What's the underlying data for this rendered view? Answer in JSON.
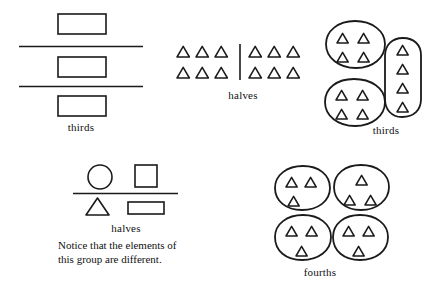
{
  "figure": {
    "stroke_color": "#1a1a1a",
    "background_color": "#ffffff"
  },
  "groups": [
    {
      "id": "thirds-bars",
      "label": "thirds",
      "kind": "divided-bar-set",
      "description": "Three rectangles separated by two horizontal division lines",
      "parts": 3,
      "shapes": [
        "rectangle",
        "rectangle",
        "rectangle"
      ],
      "dividers": 2
    },
    {
      "id": "halves-triangles",
      "label": "halves",
      "kind": "set-partition",
      "description": "Twelve triangles split by a vertical line into two equal sets of six",
      "parts": 2,
      "total_items": 12,
      "items_per_part": 6,
      "rows_per_part": 2,
      "columns_per_part": 3
    },
    {
      "id": "thirds-blobs",
      "label": "thirds",
      "kind": "set-partition",
      "description": "Twelve triangles enclosed in three loops of four triangles each",
      "parts": 3,
      "total_items": 12,
      "items_per_part": 4
    },
    {
      "id": "halves-mixed",
      "label": "halves",
      "kind": "set-partition",
      "description": "Four different shapes split by a horizontal line into two sets of two",
      "parts": 2,
      "total_items": 4,
      "items_per_part": 2,
      "shapes": [
        "circle",
        "square",
        "triangle",
        "rectangle"
      ]
    },
    {
      "id": "fourths-blobs",
      "label": "fourths",
      "kind": "set-partition",
      "description": "Twelve triangles enclosed in four loops of three triangles each",
      "parts": 4,
      "total_items": 12,
      "items_per_part": 3
    }
  ],
  "captions": {
    "thirds_left": "thirds",
    "halves_top": "halves",
    "thirds_right": "thirds",
    "halves_bottom": "halves",
    "fourths": "fourths"
  },
  "note": {
    "line1": "Notice that the elements of",
    "line2": "this group are different."
  }
}
